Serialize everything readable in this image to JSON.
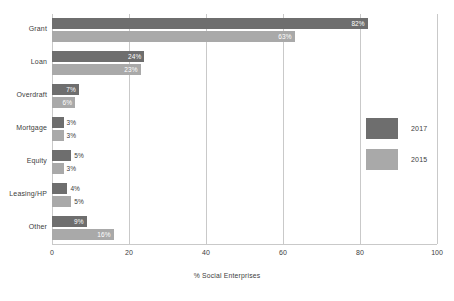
{
  "chart_data": {
    "type": "bar",
    "orientation": "horizontal",
    "title": "",
    "subtitle": "",
    "xlabel": "% Social Enterprises",
    "ylabel": "",
    "xlim": [
      0,
      100
    ],
    "xticks": [
      0,
      20,
      40,
      60,
      80,
      100
    ],
    "xtick_labels": [
      "0",
      "20",
      "40",
      "60",
      "80",
      "100"
    ],
    "grid": true,
    "grid_axis": "x",
    "legend_position": "right",
    "categories": [
      "Grant",
      "Loan",
      "Overdraft",
      "Mortgage",
      "Equity",
      "Leasing/HP",
      "Other"
    ],
    "series": [
      {
        "name": "2017",
        "color": "#6e6e6e",
        "values": [
          82,
          24,
          7,
          3,
          5,
          4,
          9
        ],
        "data_labels": [
          "82%",
          "24%",
          "7%",
          "3%",
          "5%",
          "4%",
          "9%"
        ],
        "label_placement": [
          "inside",
          "inside",
          "inside",
          "outside",
          "outside",
          "outside",
          "inside"
        ]
      },
      {
        "name": "2015",
        "color": "#a9a9a9",
        "values": [
          63,
          23,
          6,
          3,
          3,
          5,
          16
        ],
        "data_labels": [
          "63%",
          "23%",
          "6%",
          "3%",
          "3%",
          "5%",
          "16%"
        ],
        "label_placement": [
          "inside",
          "inside",
          "inside",
          "outside",
          "outside",
          "outside",
          "inside"
        ]
      }
    ]
  },
  "legend": {
    "entries": [
      {
        "label": "2017",
        "color": "#6e6e6e"
      },
      {
        "label": "2015",
        "color": "#a9a9a9"
      }
    ]
  },
  "axis": {
    "x_title": "% Social Enterprises",
    "ticks": [
      "0",
      "20",
      "40",
      "60",
      "80",
      "100"
    ]
  },
  "categories": [
    {
      "label": "Grant"
    },
    {
      "label": "Loan"
    },
    {
      "label": "Overdraft"
    },
    {
      "label": "Mortgage"
    },
    {
      "label": "Equity"
    },
    {
      "label": "Leasing/HP"
    },
    {
      "label": "Other"
    }
  ],
  "colors": {
    "series_2017": "#6e6e6e",
    "series_2015": "#a9a9a9",
    "gridline": "#c9c9c9",
    "text": "#3d3d3d",
    "background": "#ffffff"
  }
}
